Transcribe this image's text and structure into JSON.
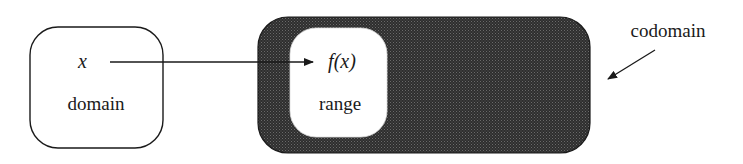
{
  "diagram": {
    "domain_box": {
      "variable": "x",
      "label": "domain"
    },
    "codomain_box": {
      "label": "codomain",
      "fill": "#3c3c3c"
    },
    "range_box": {
      "value": "f(x)",
      "label": "range"
    },
    "arrows": [
      {
        "from": "x",
        "to": "f(x)"
      },
      {
        "from": "codomain-label",
        "to": "codomain-box"
      }
    ],
    "colors": {
      "stroke": "#1a1a1a",
      "codomain_fill": "#3c3c3c",
      "background": "#ffffff"
    }
  }
}
